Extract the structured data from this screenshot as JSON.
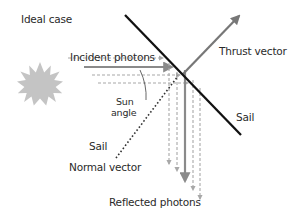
{
  "title": "Ideal case",
  "labels": {
    "incident_photons": "Incident photons",
    "thrust_vector": "Thrust vector",
    "sail_right": "Sail",
    "sail_left": "Sail",
    "sun_angle_line1": "Sun",
    "sun_angle_line2": "angle",
    "normal_vector": "Normal vector",
    "reflected_photons": "Reflected photons"
  },
  "icons": {
    "sun": "sun-icon"
  },
  "colors": {
    "sail": "#111111",
    "thrust": "#777777",
    "photon_solid": "#8a8a8a",
    "photon_dashed": "#a0a0a0",
    "sun": "#c4c4c4",
    "normal": "#333333",
    "text": "#2a2a2a"
  }
}
